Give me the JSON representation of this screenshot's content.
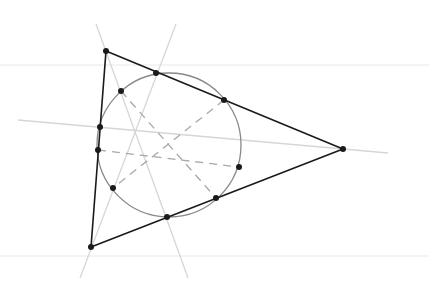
{
  "diagram": {
    "colors": {
      "background": "#ffffff",
      "triangle": "#1a1a1a",
      "circle": "#888888",
      "altitude": "#d6d6d6",
      "dashed": "#a8a8a8",
      "point": "#1a1a1a",
      "faint_rule": "#eef0f4"
    },
    "triangle": {
      "vertices": [
        {
          "name": "A",
          "x": 106,
          "y": 51
        },
        {
          "name": "B",
          "x": 343,
          "y": 149
        },
        {
          "name": "C",
          "x": 91,
          "y": 247
        }
      ]
    },
    "nine_point_circle": {
      "cx": 169,
      "cy": 145,
      "r": 72
    },
    "circle_points": [
      {
        "x": 156,
        "y": 73
      },
      {
        "x": 224,
        "y": 100
      },
      {
        "x": 239,
        "y": 167
      },
      {
        "x": 216,
        "y": 198
      },
      {
        "x": 167,
        "y": 217
      },
      {
        "x": 113,
        "y": 188
      },
      {
        "x": 98,
        "y": 150
      },
      {
        "x": 100,
        "y": 127
      },
      {
        "x": 121,
        "y": 91
      }
    ],
    "altitude_lines": [
      {
        "x1": 96,
        "y1": 24,
        "x2": 188,
        "y2": 278
      },
      {
        "x1": 176,
        "y1": 24,
        "x2": 80,
        "y2": 278
      },
      {
        "x1": 18,
        "y1": 120,
        "x2": 388,
        "y2": 153
      }
    ],
    "dashed_lines": [
      {
        "x1": 121,
        "y1": 91,
        "x2": 216,
        "y2": 198
      },
      {
        "x1": 224,
        "y1": 100,
        "x2": 113,
        "y2": 188
      },
      {
        "x1": 98,
        "y1": 150,
        "x2": 239,
        "y2": 167
      }
    ],
    "faint_rules": [
      {
        "y": 65
      },
      {
        "y": 256
      }
    ]
  }
}
